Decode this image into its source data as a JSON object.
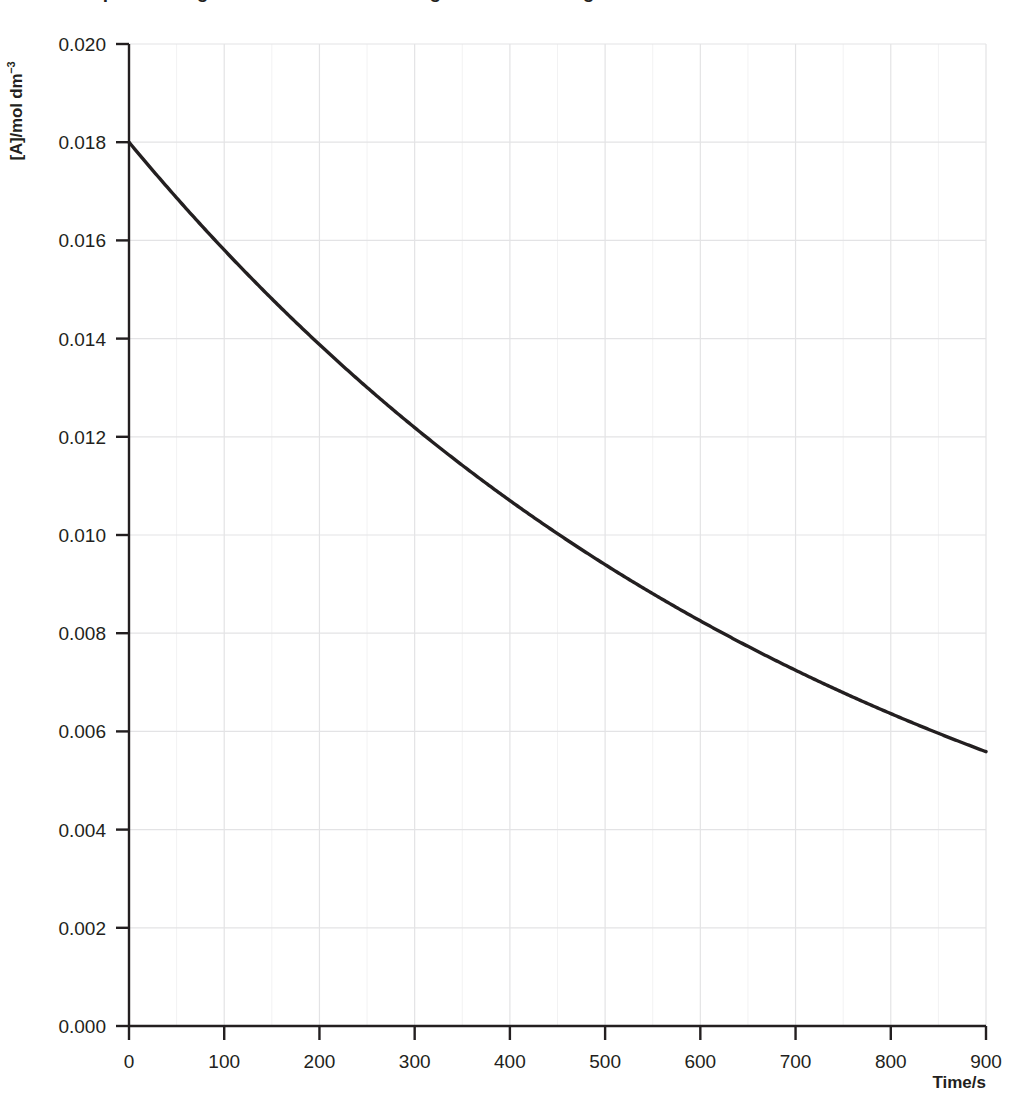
{
  "figure": {
    "title_clipped": "Graph showing the concentration of A against time during a first-order reaction",
    "background_color": "#ffffff",
    "ink_color": "#231f20",
    "grid_color": "#e3e3e5",
    "minor_grid_color": "#f2f2f3"
  },
  "axes": {
    "y_title_main": "[A]/mol dm",
    "y_title_superscript": "−3",
    "x_title": "Time/s",
    "y_ticks": [
      "0.000",
      "0.002",
      "0.004",
      "0.006",
      "0.008",
      "0.010",
      "0.012",
      "0.014",
      "0.016",
      "0.018",
      "0.020"
    ],
    "x_ticks": [
      "0",
      "100",
      "200",
      "300",
      "400",
      "500",
      "600",
      "700",
      "800",
      "900"
    ]
  },
  "chart_data": {
    "type": "line",
    "title": "Graph showing the concentration of A against time during a first-order reaction",
    "xlabel": "Time/s",
    "ylabel": "[A]/mol dm⁻³",
    "xlim": [
      0,
      900
    ],
    "ylim": [
      0.0,
      0.02
    ],
    "xticks": [
      0,
      100,
      200,
      300,
      400,
      500,
      600,
      700,
      800,
      900
    ],
    "yticks": [
      0.0,
      0.002,
      0.004,
      0.006,
      0.008,
      0.01,
      0.012,
      0.014,
      0.016,
      0.018,
      0.02
    ],
    "grid": true,
    "minor_grid_x_step": 50,
    "legend": null,
    "series": [
      {
        "name": "[A]",
        "color": "#231f20",
        "line_width": 3,
        "x": [
          0,
          50,
          100,
          150,
          200,
          250,
          300,
          350,
          400,
          450,
          500,
          550,
          600,
          650,
          700,
          750,
          800,
          850,
          900
        ],
        "y": [
          0.018,
          0.01732,
          0.01667,
          0.01605,
          0.01544,
          0.01486,
          0.0143,
          0.01376,
          0.01325,
          0.01275,
          0.01227,
          0.01181,
          0.01136,
          0.01093,
          0.01052,
          0.01013,
          0.00975,
          0.00938,
          0.00903
        ]
      }
    ],
    "model": {
      "form": "exponential_decay",
      "equation": "[A] = [A]0 * exp(-k*t)",
      "initial_concentration": 0.018,
      "rate_constant_per_s": 0.0013,
      "value_at_900s": 0.0056
    }
  }
}
